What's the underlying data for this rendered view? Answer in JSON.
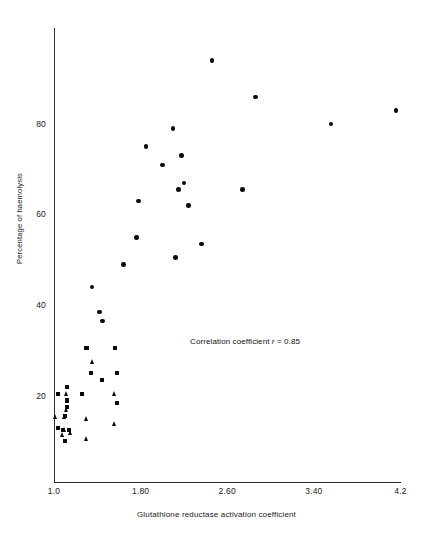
{
  "chart_data": {
    "type": "scatter",
    "title": "",
    "xlabel": "Glutathione reductase activation coefficient",
    "ylabel": "Percentage of haemolysis",
    "xlim": [
      1.0,
      4.2
    ],
    "ylim": [
      0,
      100
    ],
    "xticks": [
      "1.0",
      "1.80",
      "2.60",
      "3.40",
      "4.2"
    ],
    "xtick_values": [
      1.0,
      1.8,
      2.6,
      3.4,
      4.2
    ],
    "yticks": [
      "20",
      "40",
      "60",
      "80"
    ],
    "ytick_values": [
      20,
      40,
      60,
      80
    ],
    "grid": false,
    "legend": "none",
    "annotations": [
      {
        "text_prefix": "Correlation coefficient ",
        "symbol": "r",
        "text_suffix": " = 0.85",
        "x": 2.35,
        "y": 31
      }
    ],
    "series": [
      {
        "name": "circle-markers",
        "marker": "circle",
        "points": [
          [
            2.46,
            94
          ],
          [
            2.86,
            86
          ],
          [
            3.56,
            80
          ],
          [
            4.16,
            83
          ],
          [
            2.1,
            79
          ],
          [
            1.85,
            75
          ],
          [
            2.0,
            71
          ],
          [
            2.18,
            73
          ],
          [
            2.2,
            67
          ],
          [
            2.15,
            65.5
          ],
          [
            2.74,
            65.5
          ],
          [
            2.24,
            62
          ],
          [
            1.78,
            63
          ],
          [
            1.76,
            55
          ],
          [
            2.36,
            53.5
          ],
          [
            2.12,
            50.5
          ],
          [
            1.64,
            49
          ],
          [
            1.35,
            44
          ],
          [
            1.42,
            38.5
          ],
          [
            1.45,
            36.5
          ]
        ]
      },
      {
        "name": "square-markers",
        "marker": "square",
        "points": [
          [
            1.3,
            30.5
          ],
          [
            1.56,
            30.5
          ],
          [
            1.34,
            25
          ],
          [
            1.58,
            25
          ],
          [
            1.44,
            23.5
          ],
          [
            1.12,
            22
          ],
          [
            1.04,
            20.5
          ],
          [
            1.26,
            20.5
          ],
          [
            1.58,
            18.5
          ],
          [
            1.12,
            19
          ],
          [
            1.12,
            17.5
          ],
          [
            1.1,
            15.5
          ],
          [
            1.04,
            13
          ],
          [
            1.08,
            12.5
          ],
          [
            1.14,
            12.5
          ],
          [
            1.1,
            10
          ]
        ]
      },
      {
        "name": "triangle-markers",
        "marker": "triangle",
        "points": [
          [
            1.36,
            27.5
          ],
          [
            1.56,
            20.5
          ],
          [
            1.12,
            20.5
          ],
          [
            1.12,
            17
          ],
          [
            1.02,
            15.5
          ],
          [
            1.1,
            15.5
          ],
          [
            1.3,
            15
          ],
          [
            1.56,
            14
          ],
          [
            1.1,
            12.5
          ],
          [
            1.16,
            12
          ],
          [
            1.08,
            11.5
          ],
          [
            1.3,
            10.5
          ]
        ]
      }
    ]
  },
  "figure": {
    "axis_color": "#2b2b2b",
    "marker_color": "#0a0a0a",
    "background": "#ffffff"
  }
}
